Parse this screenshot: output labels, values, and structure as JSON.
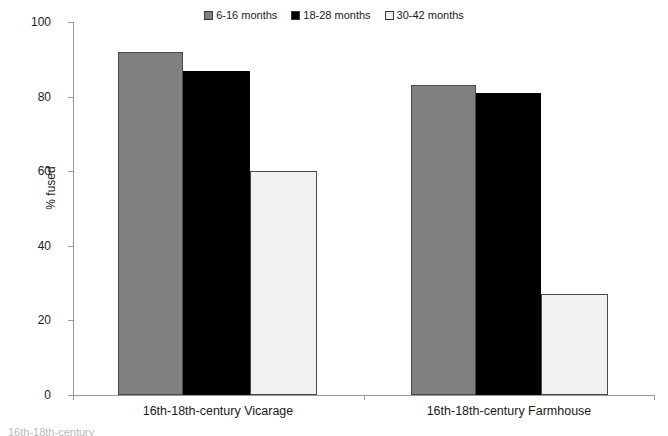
{
  "chart_data": {
    "type": "bar",
    "title": "",
    "xlabel": "",
    "ylabel": "% fused",
    "ylim": [
      0,
      100
    ],
    "yticks": [
      0,
      20,
      40,
      60,
      80,
      100
    ],
    "grid": false,
    "legend_position": "top-center",
    "categories": [
      "16th-18th-century Vicarage",
      "16th-18th-century Farmhouse"
    ],
    "series": [
      {
        "name": "6-16 months",
        "color": "#808080",
        "values": [
          92,
          83
        ]
      },
      {
        "name": "18-28 months",
        "color": "#000000",
        "values": [
          87,
          81
        ]
      },
      {
        "name": "30-42 months",
        "color": "#f1f1f1",
        "values": [
          60,
          27
        ]
      }
    ]
  },
  "legend": {
    "items": [
      {
        "label": "6-16 months",
        "swatch": "#808080"
      },
      {
        "label": "18-28 months",
        "swatch": "#000000"
      },
      {
        "label": "30-42 months",
        "swatch": "#f1f1f1"
      }
    ]
  },
  "axes": {
    "y_title": "% fused",
    "y_tick_labels": [
      "100",
      "80",
      "60",
      "40",
      "20",
      "0"
    ]
  },
  "categories": {
    "labels": [
      "16th-18th-century Vicarage",
      "16th-18th-century Farmhouse"
    ]
  },
  "footer": {
    "clipped_text": "16th-18th-century"
  }
}
